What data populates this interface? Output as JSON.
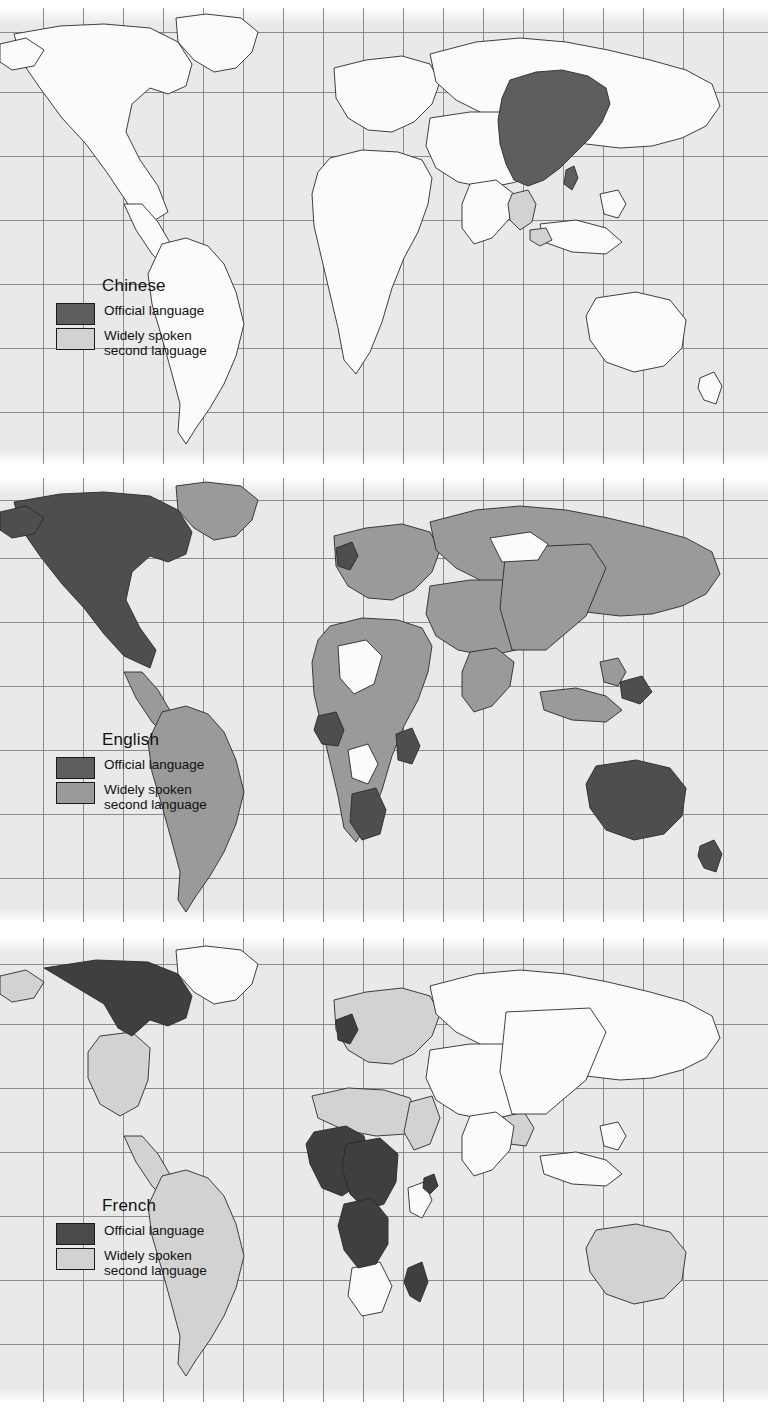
{
  "figure": {
    "type": "choropleth-world-map-series",
    "panel_count": 3,
    "projection": "cylindrical",
    "ocean_color": "#e9e9e9",
    "graticule_color": "#8a8a8a",
    "border_color": "#2a2a2a",
    "unshaded_land_color": "#fbfbfb"
  },
  "panels": [
    {
      "language": "Chinese",
      "legend": {
        "official": {
          "label": "Official language",
          "color": "#5e5e5e"
        },
        "second": {
          "label_line1": "Widely spoken",
          "label_line2": "second language",
          "color": "#d2d2d2"
        }
      },
      "official_regions": [
        "China",
        "Taiwan",
        "Hong Kong",
        "Macau"
      ],
      "second_language_regions": [
        "Singapore",
        "Malaysia",
        "Thailand",
        "Myanmar"
      ]
    },
    {
      "language": "English",
      "legend": {
        "official": {
          "label": "Official language",
          "color": "#5e5e5e"
        },
        "second": {
          "label_line1": "Widely spoken",
          "label_line2": "second language",
          "color": "#9a9a9a"
        }
      },
      "official_regions": [
        "United States",
        "Canada",
        "United Kingdom",
        "Ireland",
        "Australia",
        "New Zealand",
        "South Africa",
        "Namibia",
        "Botswana",
        "Zimbabwe",
        "Zambia",
        "Kenya",
        "Uganda",
        "Tanzania",
        "Nigeria",
        "Ghana",
        "Liberia",
        "Sierra Leone",
        "Gambia",
        "Papua New Guinea"
      ],
      "second_language_regions": [
        "Mexico",
        "Central America",
        "South America",
        "Greenland",
        "Europe",
        "Russia",
        "Middle East",
        "India",
        "Pakistan",
        "China",
        "Japan",
        "Southeast Asia",
        "North Africa",
        "East Africa",
        "West Africa"
      ]
    },
    {
      "language": "French",
      "legend": {
        "official": {
          "label": "Official language",
          "color": "#4a4a4a"
        },
        "second": {
          "label_line1": "Widely spoken",
          "label_line2": "second language",
          "color": "#d2d2d2"
        }
      },
      "official_regions": [
        "France",
        "Belgium",
        "Switzerland",
        "Canada",
        "Senegal",
        "Mali",
        "Niger",
        "Chad",
        "Burkina Faso",
        "Ivory Coast",
        "Guinea",
        "Benin",
        "Togo",
        "Central African Republic",
        "Cameroon",
        "Gabon",
        "Congo",
        "Democratic Republic of the Congo",
        "Madagascar",
        "Djibouti"
      ],
      "second_language_regions": [
        "United States",
        "Alaska",
        "Mexico",
        "South America",
        "Morocco",
        "Algeria",
        "Tunisia",
        "Egypt",
        "Europe",
        "Turkey",
        "Vietnam",
        "Laos",
        "Cambodia",
        "Australia"
      ]
    }
  ]
}
